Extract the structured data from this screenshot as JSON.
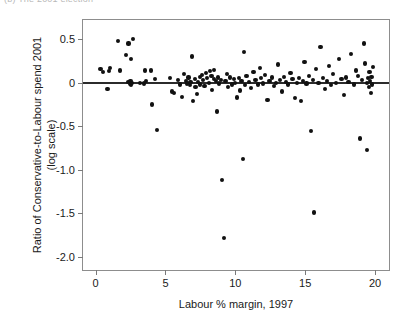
{
  "caption": {
    "text": "(b) The 2001 election"
  },
  "figure": {
    "xlabel": "Labour % margin, 1997",
    "ylabel_line1": "Ratio of Conservative-to-Labour spend 2001",
    "ylabel_line2": "(log scale)",
    "point_color": "#111111",
    "frame_color": "#8d8d8d",
    "zero_line_color": "#2b2b2b"
  },
  "chart_data": {
    "type": "scatter",
    "title": "",
    "xlabel": "Labour % margin, 1997",
    "ylabel": "Ratio of Conservative-to-Labour spend 2001 (log scale)",
    "xlim": [
      -0.9,
      21.0
    ],
    "ylim": [
      -2.15,
      0.72
    ],
    "xticks": [
      0,
      5,
      10,
      15,
      20
    ],
    "xtick_labels": [
      "0",
      "5",
      "10",
      "15",
      "20"
    ],
    "yticks": [
      0.5,
      0,
      -0.5,
      -1.0,
      -1.5,
      -2.0
    ],
    "ytick_labels": [
      "0.5",
      "0",
      "-0.5",
      "-1.0",
      "-1.5",
      "-2.0"
    ],
    "grid": false,
    "legend": null,
    "reference_lines": [
      {
        "orientation": "horizontal",
        "y": 0.0,
        "style": "solid",
        "color": "#2b2b2b"
      }
    ],
    "marker": "filled-circle",
    "points": [
      [
        0.35,
        0.16
      ],
      [
        0.55,
        0.12
      ],
      [
        0.95,
        0.13
      ],
      [
        1.05,
        0.17
      ],
      [
        0.85,
        -0.07
      ],
      [
        1.6,
        0.48
      ],
      [
        1.75,
        0.14
      ],
      [
        2.2,
        0.32
      ],
      [
        2.35,
        0.01
      ],
      [
        2.45,
        -0.01
      ],
      [
        2.5,
        0.02
      ],
      [
        2.55,
        -0.03
      ],
      [
        2.6,
        0.0
      ],
      [
        2.35,
        0.45
      ],
      [
        2.65,
        0.5
      ],
      [
        2.55,
        0.27
      ],
      [
        3.2,
        0.0
      ],
      [
        3.45,
        -0.01
      ],
      [
        3.55,
        0.14
      ],
      [
        3.95,
        0.14
      ],
      [
        3.6,
        0.02
      ],
      [
        4.05,
        -0.25
      ],
      [
        4.4,
        -0.54
      ],
      [
        4.25,
        0.04
      ],
      [
        5.3,
        0.05
      ],
      [
        5.45,
        -0.1
      ],
      [
        5.6,
        -0.12
      ],
      [
        5.9,
        0.03
      ],
      [
        6.05,
        -0.02
      ],
      [
        6.2,
        -0.16
      ],
      [
        6.35,
        0.1
      ],
      [
        6.45,
        0.02
      ],
      [
        6.55,
        -0.01
      ],
      [
        6.65,
        0.06
      ],
      [
        6.75,
        -0.03
      ],
      [
        6.8,
        0.01
      ],
      [
        6.9,
        0.3
      ],
      [
        7.0,
        -0.21
      ],
      [
        7.1,
        0.04
      ],
      [
        7.15,
        -0.05
      ],
      [
        7.25,
        -0.13
      ],
      [
        7.35,
        0.01
      ],
      [
        7.45,
        0.07
      ],
      [
        7.5,
        -0.02
      ],
      [
        7.6,
        0.09
      ],
      [
        7.7,
        0.03
      ],
      [
        7.8,
        -0.04
      ],
      [
        7.9,
        0.11
      ],
      [
        8.0,
        0.05
      ],
      [
        8.1,
        0.0
      ],
      [
        8.2,
        0.13
      ],
      [
        8.3,
        0.08
      ],
      [
        8.35,
        -0.08
      ],
      [
        8.45,
        0.04
      ],
      [
        8.5,
        0.15
      ],
      [
        8.6,
        0.02
      ],
      [
        8.7,
        -0.33
      ],
      [
        8.75,
        0.06
      ],
      [
        8.85,
        -0.01
      ],
      [
        8.95,
        0.03
      ],
      [
        9.05,
        -1.12
      ],
      [
        9.2,
        -1.78
      ],
      [
        9.3,
        0.02
      ],
      [
        9.4,
        0.1
      ],
      [
        9.5,
        -0.05
      ],
      [
        9.6,
        0.06
      ],
      [
        9.75,
        -0.02
      ],
      [
        9.9,
        0.04
      ],
      [
        10.0,
        0.0
      ],
      [
        10.15,
        -0.17
      ],
      [
        10.25,
        0.05
      ],
      [
        10.35,
        -0.09
      ],
      [
        10.45,
        0.02
      ],
      [
        10.6,
        0.35
      ],
      [
        10.7,
        -0.03
      ],
      [
        10.8,
        0.08
      ],
      [
        10.55,
        -0.88
      ],
      [
        11.0,
        0.01
      ],
      [
        11.15,
        -0.06
      ],
      [
        11.3,
        0.12
      ],
      [
        11.45,
        0.03
      ],
      [
        11.6,
        -0.02
      ],
      [
        11.75,
        0.17
      ],
      [
        11.85,
        0.05
      ],
      [
        12.0,
        -0.01
      ],
      [
        12.15,
        0.09
      ],
      [
        12.3,
        -0.2
      ],
      [
        12.45,
        0.02
      ],
      [
        12.6,
        0.06
      ],
      [
        12.75,
        -0.04
      ],
      [
        12.9,
        0.0
      ],
      [
        13.05,
        0.21
      ],
      [
        13.2,
        0.03
      ],
      [
        13.35,
        -0.1
      ],
      [
        13.5,
        0.07
      ],
      [
        13.65,
        0.01
      ],
      [
        13.8,
        -0.02
      ],
      [
        13.95,
        0.11
      ],
      [
        14.1,
        0.04
      ],
      [
        14.25,
        -0.18
      ],
      [
        14.4,
        0.0
      ],
      [
        14.55,
        0.05
      ],
      [
        14.7,
        -0.21
      ],
      [
        14.85,
        0.02
      ],
      [
        14.95,
        0.24
      ],
      [
        15.1,
        -0.01
      ],
      [
        15.25,
        0.08
      ],
      [
        15.4,
        -0.55
      ],
      [
        15.55,
        0.03
      ],
      [
        15.65,
        -1.49
      ],
      [
        15.8,
        0.16
      ],
      [
        15.95,
        0.0
      ],
      [
        16.1,
        0.41
      ],
      [
        16.25,
        0.05
      ],
      [
        16.4,
        -0.07
      ],
      [
        16.55,
        0.02
      ],
      [
        16.7,
        0.19
      ],
      [
        16.85,
        -0.03
      ],
      [
        17.0,
        0.1
      ],
      [
        17.2,
        0.0
      ],
      [
        17.4,
        0.27
      ],
      [
        17.6,
        0.04
      ],
      [
        17.8,
        -0.14
      ],
      [
        17.95,
        0.06
      ],
      [
        18.1,
        0.01
      ],
      [
        18.3,
        0.33
      ],
      [
        18.5,
        -0.02
      ],
      [
        18.65,
        0.14
      ],
      [
        18.8,
        0.08
      ],
      [
        18.9,
        -0.64
      ],
      [
        19.05,
        0.03
      ],
      [
        19.2,
        0.45
      ],
      [
        19.3,
        0.22
      ],
      [
        19.4,
        0.0
      ],
      [
        19.5,
        0.05
      ],
      [
        19.55,
        -0.05
      ],
      [
        19.6,
        0.12
      ],
      [
        19.65,
        0.02
      ],
      [
        19.7,
        -0.12
      ],
      [
        19.75,
        0.07
      ],
      [
        19.8,
        -0.02
      ],
      [
        19.85,
        0.18
      ],
      [
        19.45,
        -0.77
      ]
    ]
  }
}
